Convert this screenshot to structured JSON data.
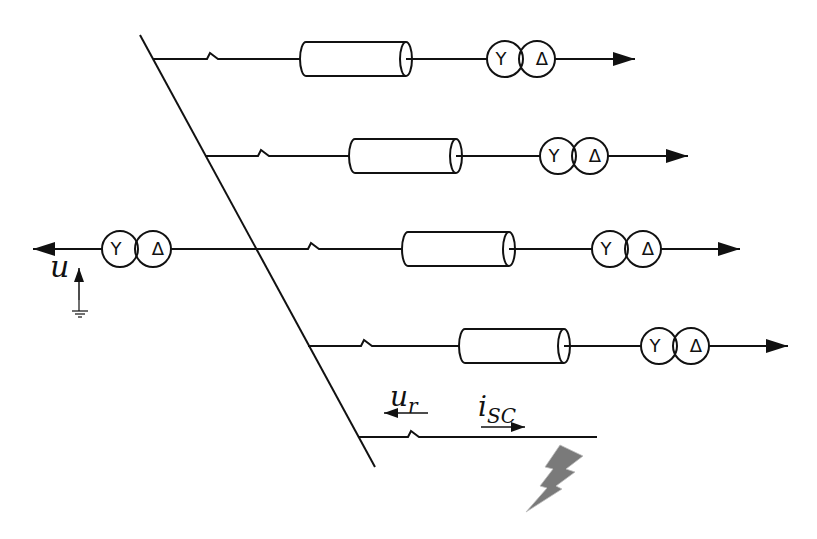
{
  "diagram": {
    "type": "single-line power distribution diagram with fault",
    "colors": {
      "line": "#111111",
      "fault": "#7a7a7a",
      "background": "#ffffff"
    },
    "labels": {
      "source_voltage": "u",
      "residual_voltage_main": "u",
      "residual_voltage_sub": "r",
      "short_circuit_current_main": "i",
      "short_circuit_current_sub": "SC"
    },
    "transformer_symbols": {
      "primary": "Y",
      "secondary": "Δ"
    },
    "feeders": [
      {
        "id": 1,
        "elements": [
          "breaker",
          "cable",
          "transformer-YΔ",
          "load-arrow"
        ]
      },
      {
        "id": 2,
        "elements": [
          "breaker",
          "cable",
          "transformer-YΔ",
          "load-arrow"
        ]
      },
      {
        "id": 3,
        "elements": [
          "breaker",
          "cable",
          "transformer-YΔ",
          "load-arrow"
        ]
      },
      {
        "id": 4,
        "elements": [
          "breaker",
          "cable",
          "transformer-YΔ",
          "load-arrow"
        ]
      },
      {
        "id": 5,
        "elements": [
          "breaker",
          "fault"
        ]
      }
    ],
    "source": {
      "elements": [
        "source-arrow",
        "transformer-YΔ",
        "voltage-arrow",
        "ground"
      ]
    }
  }
}
